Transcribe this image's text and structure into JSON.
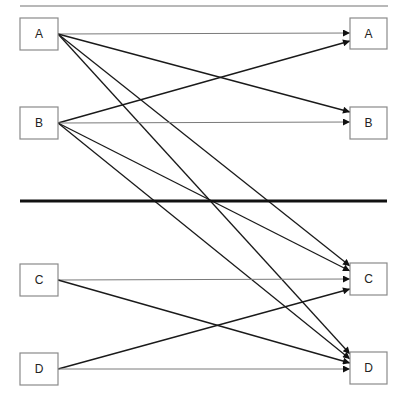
{
  "diagram": {
    "type": "bipartite-mapping",
    "left_nodes": [
      {
        "id": "A",
        "label": "A",
        "x": 20,
        "y": 18,
        "w": 38,
        "h": 32
      },
      {
        "id": "B",
        "label": "B",
        "x": 20,
        "y": 107,
        "w": 38,
        "h": 32
      },
      {
        "id": "C",
        "label": "C",
        "x": 20,
        "y": 264,
        "w": 38,
        "h": 32
      },
      {
        "id": "D",
        "label": "D",
        "x": 20,
        "y": 353,
        "w": 38,
        "h": 32
      }
    ],
    "right_nodes": [
      {
        "id": "A",
        "label": "A",
        "x": 350,
        "y": 18,
        "w": 37,
        "h": 31
      },
      {
        "id": "B",
        "label": "B",
        "x": 350,
        "y": 107,
        "w": 37,
        "h": 32
      },
      {
        "id": "C",
        "label": "C",
        "x": 350,
        "y": 263,
        "w": 37,
        "h": 32
      },
      {
        "id": "D",
        "label": "D",
        "x": 350,
        "y": 352,
        "w": 37,
        "h": 32
      }
    ],
    "edges": [
      {
        "from": "A",
        "to": "A",
        "x1": 58,
        "y1": 34,
        "x2": 350,
        "y2": 33,
        "style": "light"
      },
      {
        "from": "A",
        "to": "B",
        "x1": 58,
        "y1": 34,
        "x2": 350,
        "y2": 112,
        "style": "dark"
      },
      {
        "from": "A",
        "to": "C",
        "x1": 58,
        "y1": 34,
        "x2": 350,
        "y2": 266,
        "style": "dark"
      },
      {
        "from": "A",
        "to": "D",
        "x1": 58,
        "y1": 34,
        "x2": 350,
        "y2": 354,
        "style": "dark"
      },
      {
        "from": "B",
        "to": "A",
        "x1": 58,
        "y1": 123,
        "x2": 350,
        "y2": 41,
        "style": "dark"
      },
      {
        "from": "B",
        "to": "B",
        "x1": 58,
        "y1": 123,
        "x2": 350,
        "y2": 122,
        "style": "light"
      },
      {
        "from": "B",
        "to": "C",
        "x1": 58,
        "y1": 123,
        "x2": 350,
        "y2": 271,
        "style": "dark"
      },
      {
        "from": "B",
        "to": "D",
        "x1": 58,
        "y1": 123,
        "x2": 350,
        "y2": 359,
        "style": "dark"
      },
      {
        "from": "C",
        "to": "C",
        "x1": 58,
        "y1": 280,
        "x2": 350,
        "y2": 279,
        "style": "light"
      },
      {
        "from": "C",
        "to": "D",
        "x1": 58,
        "y1": 280,
        "x2": 350,
        "y2": 363,
        "style": "dark"
      },
      {
        "from": "D",
        "to": "C",
        "x1": 58,
        "y1": 369,
        "x2": 350,
        "y2": 289,
        "style": "dark"
      },
      {
        "from": "D",
        "to": "D",
        "x1": 58,
        "y1": 369,
        "x2": 350,
        "y2": 369,
        "style": "light"
      }
    ],
    "top_rule": {
      "x1": 20,
      "y1": 6,
      "x2": 388,
      "y2": 6
    },
    "divider": {
      "x1": 20,
      "y1": 201,
      "x2": 387,
      "y2": 201
    },
    "colors": {
      "edge": "#1a1a1a",
      "box_border": "#8a8a8a",
      "divider": "#111111",
      "top_rule": "#a0a0a0"
    }
  }
}
